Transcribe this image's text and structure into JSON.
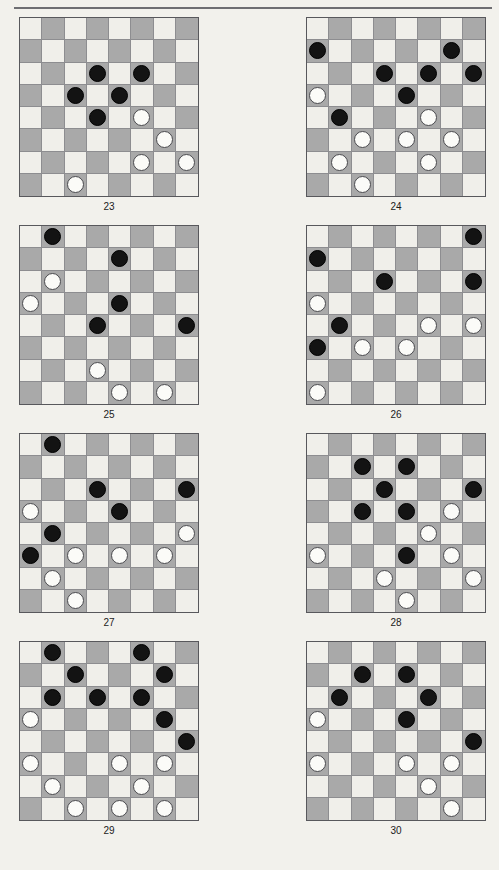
{
  "page": {
    "running_head": "",
    "background_color": "#f2f1ec",
    "rule_color": "#6e6e72"
  },
  "board_style": {
    "light_square_color": "#f0efea",
    "dark_square_color": "#a9a9a9",
    "black_piece_color": "#131313",
    "white_piece_color": "#fbfbf8",
    "border_color": "#58585c",
    "rows": 8,
    "cols": 8,
    "top_left_square": "light"
  },
  "diagrams": [
    {
      "caption": "23",
      "column": "left",
      "pieces": [
        {
          "row": 2,
          "col": 3,
          "color": "black"
        },
        {
          "row": 2,
          "col": 5,
          "color": "black"
        },
        {
          "row": 3,
          "col": 2,
          "color": "black"
        },
        {
          "row": 3,
          "col": 4,
          "color": "black"
        },
        {
          "row": 4,
          "col": 3,
          "color": "black"
        },
        {
          "row": 4,
          "col": 5,
          "color": "white"
        },
        {
          "row": 5,
          "col": 6,
          "color": "white"
        },
        {
          "row": 6,
          "col": 5,
          "color": "white"
        },
        {
          "row": 6,
          "col": 7,
          "color": "white"
        },
        {
          "row": 7,
          "col": 2,
          "color": "white"
        }
      ]
    },
    {
      "caption": "24",
      "column": "right",
      "pieces": [
        {
          "row": 1,
          "col": 0,
          "color": "black"
        },
        {
          "row": 1,
          "col": 6,
          "color": "black"
        },
        {
          "row": 2,
          "col": 3,
          "color": "black"
        },
        {
          "row": 2,
          "col": 5,
          "color": "black"
        },
        {
          "row": 2,
          "col": 7,
          "color": "black"
        },
        {
          "row": 3,
          "col": 0,
          "color": "white"
        },
        {
          "row": 3,
          "col": 4,
          "color": "black"
        },
        {
          "row": 4,
          "col": 1,
          "color": "black"
        },
        {
          "row": 4,
          "col": 5,
          "color": "white"
        },
        {
          "row": 5,
          "col": 2,
          "color": "white"
        },
        {
          "row": 5,
          "col": 4,
          "color": "white"
        },
        {
          "row": 5,
          "col": 6,
          "color": "white"
        },
        {
          "row": 6,
          "col": 1,
          "color": "white"
        },
        {
          "row": 6,
          "col": 5,
          "color": "white"
        },
        {
          "row": 7,
          "col": 2,
          "color": "white"
        }
      ]
    },
    {
      "caption": "25",
      "column": "left",
      "pieces": [
        {
          "row": 0,
          "col": 1,
          "color": "black"
        },
        {
          "row": 1,
          "col": 4,
          "color": "black"
        },
        {
          "row": 2,
          "col": 1,
          "color": "white"
        },
        {
          "row": 3,
          "col": 0,
          "color": "white"
        },
        {
          "row": 3,
          "col": 4,
          "color": "black"
        },
        {
          "row": 4,
          "col": 3,
          "color": "black"
        },
        {
          "row": 4,
          "col": 7,
          "color": "black"
        },
        {
          "row": 6,
          "col": 3,
          "color": "white"
        },
        {
          "row": 7,
          "col": 4,
          "color": "white"
        },
        {
          "row": 7,
          "col": 6,
          "color": "white"
        }
      ]
    },
    {
      "caption": "26",
      "column": "right",
      "pieces": [
        {
          "row": 0,
          "col": 7,
          "color": "black"
        },
        {
          "row": 1,
          "col": 0,
          "color": "black"
        },
        {
          "row": 2,
          "col": 3,
          "color": "black"
        },
        {
          "row": 2,
          "col": 7,
          "color": "black"
        },
        {
          "row": 3,
          "col": 0,
          "color": "white"
        },
        {
          "row": 4,
          "col": 1,
          "color": "black"
        },
        {
          "row": 4,
          "col": 5,
          "color": "white"
        },
        {
          "row": 4,
          "col": 7,
          "color": "white"
        },
        {
          "row": 5,
          "col": 0,
          "color": "black"
        },
        {
          "row": 5,
          "col": 2,
          "color": "white"
        },
        {
          "row": 5,
          "col": 4,
          "color": "white"
        },
        {
          "row": 7,
          "col": 0,
          "color": "white"
        }
      ]
    },
    {
      "caption": "27",
      "column": "left",
      "pieces": [
        {
          "row": 0,
          "col": 1,
          "color": "black"
        },
        {
          "row": 2,
          "col": 3,
          "color": "black"
        },
        {
          "row": 2,
          "col": 7,
          "color": "black"
        },
        {
          "row": 3,
          "col": 0,
          "color": "white"
        },
        {
          "row": 3,
          "col": 4,
          "color": "black"
        },
        {
          "row": 4,
          "col": 1,
          "color": "black"
        },
        {
          "row": 4,
          "col": 7,
          "color": "white"
        },
        {
          "row": 5,
          "col": 0,
          "color": "black"
        },
        {
          "row": 5,
          "col": 2,
          "color": "white"
        },
        {
          "row": 5,
          "col": 4,
          "color": "white"
        },
        {
          "row": 5,
          "col": 6,
          "color": "white"
        },
        {
          "row": 6,
          "col": 1,
          "color": "white"
        },
        {
          "row": 7,
          "col": 2,
          "color": "white"
        }
      ]
    },
    {
      "caption": "28",
      "column": "right",
      "pieces": [
        {
          "row": 1,
          "col": 2,
          "color": "black"
        },
        {
          "row": 1,
          "col": 4,
          "color": "black"
        },
        {
          "row": 2,
          "col": 3,
          "color": "black"
        },
        {
          "row": 2,
          "col": 7,
          "color": "black"
        },
        {
          "row": 3,
          "col": 2,
          "color": "black"
        },
        {
          "row": 3,
          "col": 4,
          "color": "black"
        },
        {
          "row": 3,
          "col": 6,
          "color": "white"
        },
        {
          "row": 4,
          "col": 5,
          "color": "white"
        },
        {
          "row": 5,
          "col": 0,
          "color": "white"
        },
        {
          "row": 5,
          "col": 4,
          "color": "black"
        },
        {
          "row": 5,
          "col": 6,
          "color": "white"
        },
        {
          "row": 6,
          "col": 3,
          "color": "white"
        },
        {
          "row": 6,
          "col": 7,
          "color": "white"
        },
        {
          "row": 7,
          "col": 4,
          "color": "white"
        }
      ]
    },
    {
      "caption": "29",
      "column": "left",
      "pieces": [
        {
          "row": 0,
          "col": 1,
          "color": "black"
        },
        {
          "row": 0,
          "col": 5,
          "color": "black"
        },
        {
          "row": 1,
          "col": 2,
          "color": "black"
        },
        {
          "row": 1,
          "col": 6,
          "color": "black"
        },
        {
          "row": 2,
          "col": 1,
          "color": "black"
        },
        {
          "row": 2,
          "col": 3,
          "color": "black"
        },
        {
          "row": 2,
          "col": 5,
          "color": "black"
        },
        {
          "row": 3,
          "col": 0,
          "color": "white"
        },
        {
          "row": 3,
          "col": 6,
          "color": "black"
        },
        {
          "row": 4,
          "col": 7,
          "color": "black"
        },
        {
          "row": 5,
          "col": 0,
          "color": "white"
        },
        {
          "row": 5,
          "col": 4,
          "color": "white"
        },
        {
          "row": 5,
          "col": 6,
          "color": "white"
        },
        {
          "row": 6,
          "col": 1,
          "color": "white"
        },
        {
          "row": 6,
          "col": 5,
          "color": "white"
        },
        {
          "row": 7,
          "col": 2,
          "color": "white"
        },
        {
          "row": 7,
          "col": 4,
          "color": "white"
        },
        {
          "row": 7,
          "col": 6,
          "color": "white"
        }
      ]
    },
    {
      "caption": "30",
      "column": "right",
      "pieces": [
        {
          "row": 1,
          "col": 2,
          "color": "black"
        },
        {
          "row": 1,
          "col": 4,
          "color": "black"
        },
        {
          "row": 2,
          "col": 1,
          "color": "black"
        },
        {
          "row": 2,
          "col": 5,
          "color": "black"
        },
        {
          "row": 3,
          "col": 0,
          "color": "white"
        },
        {
          "row": 3,
          "col": 4,
          "color": "black"
        },
        {
          "row": 4,
          "col": 7,
          "color": "black"
        },
        {
          "row": 5,
          "col": 0,
          "color": "white"
        },
        {
          "row": 5,
          "col": 4,
          "color": "white"
        },
        {
          "row": 5,
          "col": 6,
          "color": "white"
        },
        {
          "row": 6,
          "col": 5,
          "color": "white"
        },
        {
          "row": 7,
          "col": 6,
          "color": "white"
        }
      ]
    }
  ]
}
